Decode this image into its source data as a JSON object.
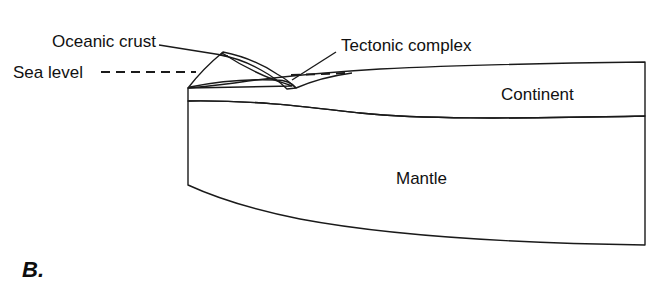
{
  "figure": {
    "panel_letter": "B.",
    "background_color": "#ffffff",
    "width": 653,
    "height": 288
  },
  "labels": {
    "oceanic_crust": "Oceanic crust",
    "sea_level": "Sea level",
    "tectonic_complex": "Tectonic complex",
    "continent": "Continent",
    "mantle": "Mantle"
  },
  "layers": {
    "mantle": {
      "name": "Mantle",
      "fill_color": "#c4c4c4",
      "stroke_color": "#1a1a1a"
    },
    "continent": {
      "name": "Continent",
      "fill_color": "#ffffff",
      "pattern": "stipple-dots",
      "dot_color": "#1a1a1a",
      "stroke_color": "#1a1a1a"
    },
    "accretionary_wedge": {
      "name": "Accretionary wedge",
      "fill_color": "#cfcfcf",
      "stroke_color": "#1a1a1a"
    },
    "oceanic_crust": {
      "name": "Oceanic crust",
      "fill_color": "#5a5a5a",
      "stroke_color": "#1a1a1a"
    }
  },
  "annotations": {
    "sea_level_line_style": "dashed",
    "leader_lines": 2
  }
}
